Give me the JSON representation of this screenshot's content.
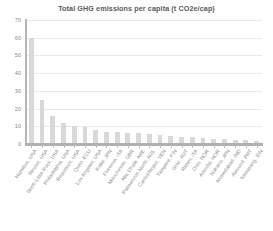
{
  "chart_data": {
    "type": "bar",
    "title": "Total GHG emissions per capita (t CO2e/cap)",
    "xlabel": "",
    "ylabel": "",
    "ylim": [
      0,
      70
    ],
    "yticks": [
      0,
      10,
      20,
      30,
      40,
      50,
      60,
      70
    ],
    "grid": true,
    "legend": false,
    "bar_color": "#d8d8d8",
    "categories": [
      "Hamilton, USA",
      "Reston, USA",
      "North Little Rock, USA",
      "Philadelphia, USA",
      "Beaumont, USA",
      "Quito, ECU",
      "Los Angeles, USA",
      "Kobe, JPN",
      "Florence, ITA",
      "Manchester, GBR",
      "Abu Dhabi, ARE",
      "Palmerston North, NZL",
      "Carrickfergus, VEN",
      "Tampere, FIN",
      "Graz, AUT",
      "Rimini, ITA",
      "Oslo, NOR",
      "Arendal, NOR",
      "Nakano, JPN",
      "Ahmedabad, IND",
      "Alesund, PRT",
      "Semarang, IDN"
    ],
    "values": [
      60,
      25,
      16,
      12,
      10,
      9.8,
      8,
      7,
      6.8,
      6.2,
      6,
      5.6,
      5.2,
      4.6,
      4.2,
      3.8,
      3.4,
      3.1,
      2.8,
      2.5,
      2.2,
      1.6
    ]
  },
  "yaxis": {
    "ticklabels": [
      "70",
      "60",
      "50",
      "40",
      "30",
      "20",
      "10",
      "0"
    ]
  }
}
